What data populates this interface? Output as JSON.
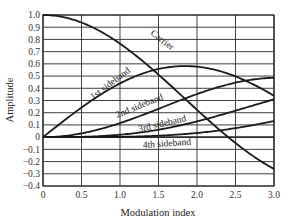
{
  "chart_data": {
    "type": "line",
    "title": "",
    "xlabel": "Modulation index",
    "ylabel": "Amplitude",
    "xlim": [
      0,
      3.0
    ],
    "ylim": [
      -0.4,
      1.0
    ],
    "grid": true,
    "legend": "inline curve labels",
    "x_ticks": [
      "0",
      "0.5",
      "1.0",
      "1.5",
      "2.0",
      "2.5",
      "3.0"
    ],
    "y_ticks": [
      "1.0",
      "0.9",
      "0.8",
      "0.7",
      "0.6",
      "0.5",
      "0.4",
      "0.3",
      "0.2",
      "0.1",
      "0",
      "−0.1",
      "−0.2",
      "−0.3",
      "−0.4"
    ],
    "x": [
      0,
      0.5,
      1.0,
      1.5,
      2.0,
      2.5,
      3.0
    ],
    "series": [
      {
        "name": "Carrier",
        "values": [
          1.0,
          0.94,
          0.77,
          0.51,
          0.22,
          -0.05,
          -0.26
        ]
      },
      {
        "name": "1st sideband",
        "values": [
          0.0,
          0.24,
          0.44,
          0.56,
          0.58,
          0.5,
          0.34
        ]
      },
      {
        "name": "2nd sideband",
        "values": [
          0.0,
          0.03,
          0.11,
          0.23,
          0.35,
          0.45,
          0.49
        ]
      },
      {
        "name": "3rd sideband",
        "values": [
          0.0,
          0.0,
          0.02,
          0.06,
          0.13,
          0.22,
          0.31
        ]
      },
      {
        "name": "4th sideband",
        "values": [
          0.0,
          0.0,
          0.0,
          0.01,
          0.03,
          0.07,
          0.13
        ]
      }
    ]
  },
  "labels": {
    "xlabel": "Modulation index",
    "ylabel": "Amplitude",
    "carrier": "Carrier",
    "sb1": "1st sideband",
    "sb2": "2nd sideband",
    "sb3": "3rd sideband",
    "sb4": "4th sideband"
  }
}
